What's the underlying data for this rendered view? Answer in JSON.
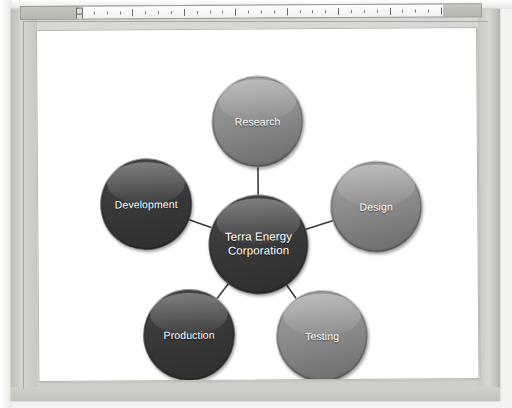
{
  "document": {
    "page_background": "#ffffff",
    "frame_color": "#d4d3ce"
  },
  "ruler": {
    "name": "horizontal-ruler",
    "unit_marks": 28,
    "major_mark_every": 4
  },
  "diagram": {
    "type": "radial-smartart",
    "center": {
      "id": "center",
      "label": "Terra Energy Corporation",
      "line1": "Terra Energy",
      "line2": "Corporation",
      "shade": "dark",
      "color": "#3a3a3a",
      "text_color": "#ffffff",
      "cx": 220,
      "cy": 215,
      "r": 50
    },
    "nodes": [
      {
        "id": "research",
        "label": "Research",
        "shade": "light",
        "color": "#8c8c8c",
        "text_color": "#ffffff",
        "cx": 220,
        "cy": 92,
        "r": 46
      },
      {
        "id": "design",
        "label": "Design",
        "shade": "light",
        "color": "#8c8c8c",
        "text_color": "#ffffff",
        "cx": 338,
        "cy": 178,
        "r": 46
      },
      {
        "id": "development",
        "label": "Development",
        "shade": "dark",
        "color": "#3a3a3a",
        "text_color": "#ffffff",
        "cx": 108,
        "cy": 174,
        "r": 46
      },
      {
        "id": "production",
        "label": "Production",
        "shade": "dark",
        "color": "#3a3a3a",
        "text_color": "#ffffff",
        "cx": 150,
        "cy": 305,
        "r": 46
      },
      {
        "id": "testing",
        "label": "Testing",
        "shade": "light",
        "color": "#8c8c8c",
        "text_color": "#ffffff",
        "cx": 283,
        "cy": 307,
        "r": 46
      }
    ],
    "connectors": [
      {
        "from": "center",
        "to": "research",
        "color": "#3c3c3c"
      },
      {
        "from": "center",
        "to": "design",
        "color": "#3c3c3c"
      },
      {
        "from": "center",
        "to": "development",
        "color": "#3c3c3c"
      },
      {
        "from": "center",
        "to": "production",
        "color": "#3c3c3c"
      },
      {
        "from": "center",
        "to": "testing",
        "color": "#3c3c3c"
      }
    ]
  }
}
